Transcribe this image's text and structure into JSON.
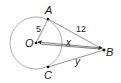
{
  "diagram": {
    "points": {
      "O": {
        "label": "O"
      },
      "A": {
        "label": "A"
      },
      "B": {
        "label": "B"
      },
      "C": {
        "label": "C"
      }
    },
    "segments": {
      "OA": {
        "label": "5"
      },
      "AB": {
        "label": "12"
      },
      "OB": {
        "label": "x"
      },
      "CB": {
        "label": "y"
      }
    },
    "colors": {
      "stroke": "#555555",
      "circle": "#9a9a9a",
      "text": "#222222"
    }
  }
}
